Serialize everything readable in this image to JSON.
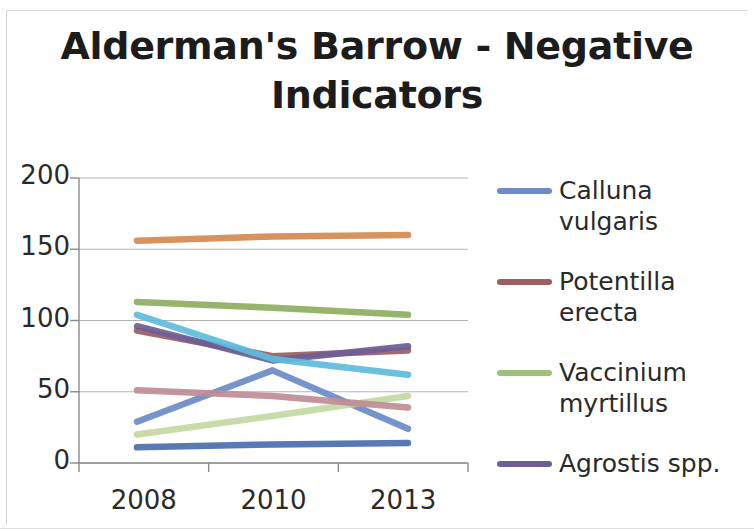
{
  "figure": {
    "title": "Alderman's Barrow - Negative\nIndicators",
    "background_color": "#ffffff"
  },
  "axes": {
    "y_ticks": [
      "200",
      "150",
      "100",
      "50",
      "0"
    ],
    "x_ticks": [
      "2008",
      "2010",
      "2013"
    ],
    "gridline_color": "#9a9a9a",
    "axis_color": "#8c8c8c"
  },
  "legend": {
    "position": "right",
    "items": [
      {
        "label": "Calluna vulgaris",
        "color": "#6a8cc8"
      },
      {
        "label": "Potentilla erecta",
        "color": "#9c5f63"
      },
      {
        "label": "Vaccinium myrtillus",
        "color": "#9ec07a"
      },
      {
        "label": "Agrostis spp.",
        "color": "#6d5f94"
      }
    ]
  },
  "chart_data": {
    "type": "line",
    "title": "Alderman's Barrow - Negative Indicators",
    "subtitle": "",
    "xlabel": "",
    "ylabel": "",
    "x": [
      "2008",
      "2010",
      "2013"
    ],
    "categories": [
      "2008",
      "2010",
      "2013"
    ],
    "ylim": [
      0,
      200
    ],
    "yticks": [
      0,
      50,
      100,
      150,
      200
    ],
    "grid": true,
    "legend_position": "right",
    "series": [
      {
        "name": "Calluna vulgaris",
        "color": "#6a8cc8",
        "values": [
          29,
          65,
          24
        ],
        "in_legend": true
      },
      {
        "name": "Potentilla erecta",
        "color": "#9c5f63",
        "values": [
          93,
          75,
          79
        ],
        "in_legend": true
      },
      {
        "name": "Vaccinium myrtillus",
        "color": "#c3d9a2",
        "values": [
          20,
          33,
          47
        ],
        "in_legend": true
      },
      {
        "name": "Agrostis spp.",
        "color": "#6d5f94",
        "values": [
          96,
          72,
          82
        ],
        "in_legend": true
      },
      {
        "name": "Series 5",
        "color": "#d48a52",
        "values": [
          156,
          159,
          160
        ],
        "in_legend": false
      },
      {
        "name": "Series 6",
        "color": "#8fae62",
        "values": [
          113,
          109,
          104
        ],
        "in_legend": false
      },
      {
        "name": "Series 7",
        "color": "#5fbcdb",
        "values": [
          104,
          73,
          62
        ],
        "in_legend": false
      },
      {
        "name": "Series 8",
        "color": "#bf8d94",
        "values": [
          51,
          47,
          39
        ],
        "in_legend": false
      },
      {
        "name": "Series 9",
        "color": "#4a6fae",
        "values": [
          11,
          13,
          14
        ],
        "in_legend": false
      }
    ]
  }
}
